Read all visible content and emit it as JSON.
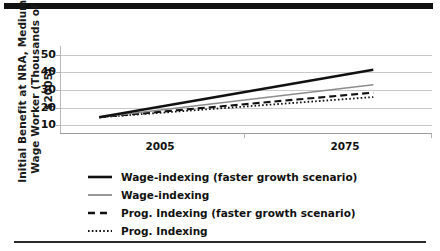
{
  "chart_data": {
    "type": "line",
    "title": "",
    "xlabel": "",
    "ylabel": "Initial Benefit at NRA, Medium-Wage Worker (Thousands of $2005)",
    "x_tick_labels": [
      "2005",
      "2075"
    ],
    "y_tick_labels": [
      "50",
      "40",
      "30",
      "20",
      "10"
    ],
    "y_ticks": [
      50,
      40,
      30,
      20,
      10
    ],
    "ylim": [
      5,
      55
    ],
    "xlim": [
      1995,
      2090
    ],
    "grid": "horizontal",
    "legend_position": "below-plot",
    "x": [
      2005,
      2075
    ],
    "series": [
      {
        "name": "Wage-indexing (faster growth scenario)",
        "style": "solid-thick-black",
        "color": "#111111",
        "values": [
          14.5,
          41.5
        ]
      },
      {
        "name": "Wage-indexing",
        "style": "solid-thin-gray",
        "color": "#8c8c8c",
        "values": [
          14.5,
          33.0
        ]
      },
      {
        "name": "Prog. Indexing (faster growth scenario)",
        "style": "dashed-black",
        "color": "#111111",
        "values": [
          14.5,
          28.5
        ]
      },
      {
        "name": "Prog. Indexing",
        "style": "dotted-black",
        "color": "#111111",
        "values": [
          14.5,
          26.0
        ]
      }
    ]
  },
  "axis": {
    "y_labels": [
      "50",
      "40",
      "30",
      "20",
      "10"
    ],
    "x_labels": [
      "2005",
      "2075"
    ]
  },
  "legend": {
    "items": [
      {
        "label": "Wage-indexing (faster growth scenario)"
      },
      {
        "label": "Wage-indexing"
      },
      {
        "label": "Prog. Indexing (faster growth scenario)"
      },
      {
        "label": "Prog. Indexing"
      }
    ]
  },
  "ylabel_text": "Initial Benefit at NRA, Medium-Wage Worker (Thousands of $2005)"
}
